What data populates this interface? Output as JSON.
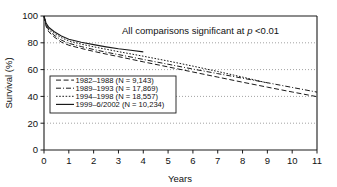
{
  "chart_data": {
    "type": "line",
    "title": "",
    "xlabel": "Years",
    "ylabel": "Survival (%)",
    "xlim": [
      0,
      11
    ],
    "ylim": [
      0,
      100
    ],
    "xticks": [
      "0",
      "1",
      "2",
      "3",
      "4",
      "5",
      "6",
      "7",
      "8",
      "9",
      "10",
      "11"
    ],
    "yticks": [
      "0",
      "20",
      "40",
      "60",
      "80",
      "100"
    ],
    "grid": "horizontal-dotted",
    "legend_position": "inside-lower-left",
    "annotations": [
      {
        "text_before": "All comparisons significant at ",
        "text_italic": "p",
        "text_after": " <0.01",
        "full_text": "All comparisons significant at p <0.01"
      }
    ],
    "series": [
      {
        "name": "1982–1988 (N = 9,143)",
        "label": "1982–1988",
        "n": "9,143",
        "style": "long-dash",
        "dasharray": "5,2.6",
        "x": [
          0,
          0.08,
          0.2,
          0.4,
          0.7,
          1,
          1.5,
          2,
          2.5,
          3,
          4,
          5,
          6,
          7,
          8,
          9,
          10,
          11
        ],
        "y": [
          100,
          92.5,
          88,
          84.5,
          80.5,
          78.2,
          75.8,
          73.6,
          71.6,
          69.7,
          65.8,
          62.0,
          58.2,
          54.4,
          50.6,
          46.9,
          43.3,
          39.8
        ]
      },
      {
        "name": "1989–1993 (N = 17,869)",
        "label": "1989–1993",
        "n": "17,869",
        "style": "dash-dot",
        "dasharray": "5,2,1,2",
        "x": [
          0,
          0.08,
          0.2,
          0.4,
          0.7,
          1,
          1.5,
          2,
          2.5,
          3,
          4,
          5,
          6,
          7,
          8,
          9,
          10,
          11
        ],
        "y": [
          100,
          93.2,
          89.2,
          85.8,
          82.0,
          79.6,
          77.2,
          75.0,
          73.0,
          71.2,
          67.6,
          64.0,
          60.4,
          57.0,
          53.6,
          50.2,
          46.7,
          43.2
        ]
      },
      {
        "name": "1994–1998 (N = 18,557)",
        "label": "1994–1998",
        "n": "18,557",
        "style": "dotted",
        "dasharray": "1.6,1.6",
        "x": [
          0,
          0.08,
          0.2,
          0.4,
          0.7,
          1,
          1.5,
          2,
          2.5,
          3,
          4,
          5,
          6,
          7,
          8,
          8.6,
          9
        ],
        "y": [
          100,
          94.0,
          90.4,
          87.2,
          83.8,
          81.4,
          79.0,
          77.0,
          75.2,
          73.4,
          70.0,
          66.4,
          62.6,
          58.6,
          54.4,
          51.8,
          50.0
        ]
      },
      {
        "name": "1999–6/2002 (N = 10,234)",
        "label": "1999–6/2002",
        "n": "10,234",
        "style": "solid",
        "dasharray": "none",
        "x": [
          0,
          0.08,
          0.2,
          0.4,
          0.7,
          1,
          1.5,
          2,
          2.5,
          3,
          3.5,
          4
        ],
        "y": [
          100,
          94.8,
          91.4,
          88.4,
          85.0,
          82.6,
          80.4,
          78.6,
          77.0,
          75.6,
          74.4,
          73.2
        ]
      }
    ],
    "colors": {
      "line": "#1a1a1a",
      "grid": "#8a8a8a",
      "axis": "#1a1a1a",
      "background": "#ffffff"
    }
  }
}
